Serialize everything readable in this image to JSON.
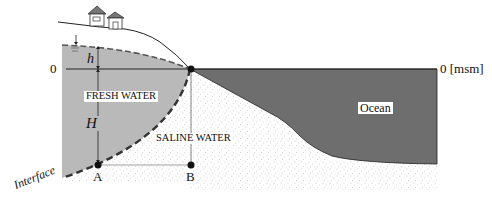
{
  "diagram": {
    "labels": {
      "zero_left": "0",
      "zero_right": "0 [msm]",
      "h": "h",
      "H": "H",
      "fresh_water": "FRESH WATER",
      "saline_water": "SALINE WATER",
      "ocean": "Ocean",
      "point_a": "A",
      "point_b": "B",
      "interface": "Interface"
    },
    "colors": {
      "fresh_water": "#b9b9b9",
      "ocean": "#6e6e6e",
      "saline_stipple": "#9a9a9a",
      "lines": "#222222"
    }
  }
}
